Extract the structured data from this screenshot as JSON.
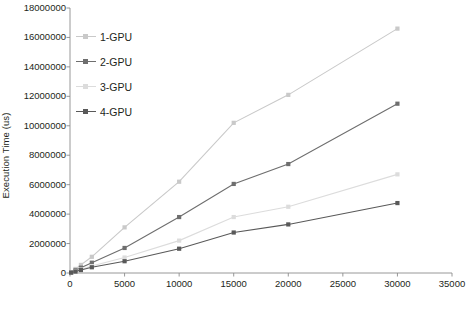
{
  "chart_data": {
    "type": "line",
    "title": "",
    "xlabel": "Number of Runs",
    "ylabel": "Execution Time (us)",
    "xlim": [
      0,
      35000
    ],
    "ylim": [
      0,
      18000000
    ],
    "xticks": [
      0,
      5000,
      10000,
      15000,
      20000,
      25000,
      30000,
      35000
    ],
    "ytick_labels": [
      "0",
      "2000000",
      "4000000",
      "6000000",
      "8000000",
      "10000000",
      "12000000",
      "14000000",
      "16000000",
      "18000000"
    ],
    "yticks": [
      0,
      2000000,
      4000000,
      6000000,
      8000000,
      10000000,
      12000000,
      14000000,
      16000000,
      18000000
    ],
    "grid": false,
    "legend_position": "upper-left-inside",
    "x": [
      100,
      500,
      1000,
      2000,
      5000,
      10000,
      15000,
      20000,
      30000
    ],
    "series": [
      {
        "name": "1-GPU",
        "color": "#c9c9c9",
        "values": [
          55000,
          275000,
          550000,
          1100000,
          3100000,
          6200000,
          10200000,
          12100000,
          16600000
        ]
      },
      {
        "name": "2-GPU",
        "color": "#6e6e6e",
        "values": [
          40000,
          180000,
          360000,
          700000,
          1700000,
          3800000,
          6050000,
          7400000,
          11500000
        ]
      },
      {
        "name": "3-GPU",
        "color": "#dcdcdc",
        "values": [
          30000,
          120000,
          240000,
          470000,
          1050000,
          2200000,
          3800000,
          4500000,
          6700000
        ]
      },
      {
        "name": "4-GPU",
        "color": "#595959",
        "values": [
          25000,
          100000,
          200000,
          390000,
          800000,
          1650000,
          2750000,
          3300000,
          4750000
        ]
      }
    ]
  }
}
